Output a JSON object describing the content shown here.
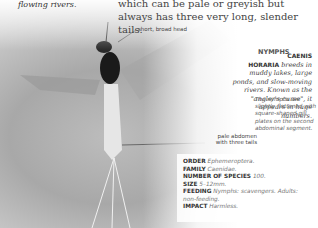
{
  "intro": {
    "top_left_fragment": "flowing rivers.",
    "top_text": "which can be pale or greyish but always has three very long, slender tails."
  },
  "annotations": {
    "head": "short, broad head",
    "abdomen": "pale abdomen with three tails"
  },
  "species": {
    "name_line1": "CAENIS",
    "name_line2": "HORARIA",
    "description": "breeds in muddy lakes, large ponds, and slow-moving rivers. Known as the \"angler's curse\", it appears in huge numbers."
  },
  "nymphs": {
    "title": "NYMPHS",
    "caption": "The nymphs are slightly flattened with square-shaped gill plates on the second abdominal segment."
  },
  "facts": [
    {
      "label": "ORDER",
      "value": "Ephemeroptera."
    },
    {
      "label": "FAMILY",
      "value": "Caenidae."
    },
    {
      "label": "NUMBER OF SPECIES",
      "value": "100."
    },
    {
      "label": "SIZE",
      "value": "5–12mm."
    },
    {
      "label": "FEEDING",
      "value": "Nymphs: scavengers. Adults: non-feeding."
    },
    {
      "label": "IMPACT",
      "value": "Harmless."
    }
  ]
}
